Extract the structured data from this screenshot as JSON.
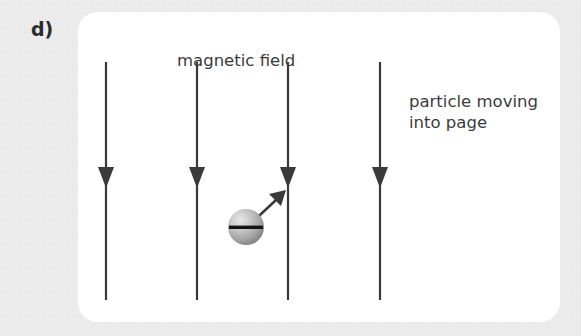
{
  "figure": {
    "label": "d)",
    "caption_field": "magnetic field",
    "caption_particle_line1": "particle moving",
    "caption_particle_line2": "into page"
  },
  "colors": {
    "page_background": "#ededed",
    "card_background": "#ffffff",
    "field_line": "#3a3a3a",
    "text": "#3c3c3c",
    "label_text": "#2b2b2b",
    "particle_light": "#e2e2e2",
    "particle_mid": "#a9a9a9",
    "particle_dark": "#6e6e6e",
    "charge_sign": "#1a1a1a"
  },
  "diagram": {
    "type": "physics-field-diagram",
    "field_lines": [
      {
        "name": "field-line-1",
        "x": 106,
        "y_top": 62,
        "y_bottom": 300,
        "arrow_y": 186,
        "direction": "down"
      },
      {
        "name": "field-line-2",
        "x": 197,
        "y_top": 62,
        "y_bottom": 300,
        "arrow_y": 186,
        "direction": "down"
      },
      {
        "name": "field-line-3",
        "x": 288,
        "y_top": 62,
        "y_bottom": 300,
        "arrow_y": 186,
        "direction": "down"
      },
      {
        "name": "field-line-4",
        "x": 380,
        "y_top": 62,
        "y_bottom": 300,
        "arrow_y": 186,
        "direction": "down"
      }
    ],
    "particle": {
      "name": "charged-particle",
      "charge": "negative",
      "charge_symbol": "minus",
      "center_x": 246,
      "center_y": 227,
      "radius": 18
    },
    "velocity_arrow": {
      "name": "velocity-arrow",
      "from_x": 255,
      "from_y": 218,
      "to_x": 285,
      "to_y": 191,
      "direction": "up-right"
    },
    "labels": [
      {
        "name": "magnetic-field-label",
        "x": 177,
        "y": 66
      },
      {
        "name": "particle-label-line1",
        "x": 409,
        "y": 107
      },
      {
        "name": "particle-label-line2",
        "x": 409,
        "y": 128
      }
    ]
  }
}
